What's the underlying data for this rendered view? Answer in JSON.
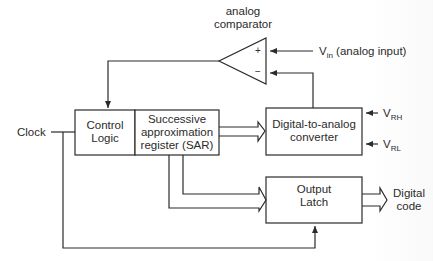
{
  "diagram": {
    "colors": {
      "line": "#2b2b2b",
      "background": "#ffffff"
    },
    "comparator": {
      "label_line1": "analog",
      "label_line2": "comparator",
      "plus": "+",
      "minus": "−"
    },
    "inputs": {
      "vin_main": "V",
      "vin_sub": "in",
      "vin_desc": "(analog input)",
      "vrh_main": "V",
      "vrh_sub": "RH",
      "vrl_main": "V",
      "vrl_sub": "RL",
      "clock": "Clock"
    },
    "blocks": {
      "control_logic": {
        "line1": "Control",
        "line2": "Logic"
      },
      "sar": {
        "line1": "Successive",
        "line2": "approximation",
        "line3": "register (SAR)"
      },
      "dac": {
        "line1": "Digital-to-analog",
        "line2": "converter"
      },
      "latch": {
        "line1": "Output",
        "line2": "Latch"
      }
    },
    "outputs": {
      "line1": "Digital",
      "line2": "code"
    },
    "connections": [
      "Vin -> comparator(+)",
      "DAC -> comparator(-)",
      "comparator -> Control Logic",
      "Clock -> Control Logic",
      "Clock -> Output Latch",
      "SAR => DAC (bus)",
      "SAR => Output Latch (bus)",
      "VRH -> DAC",
      "VRL -> DAC",
      "Output Latch => Digital code (bus)"
    ]
  }
}
